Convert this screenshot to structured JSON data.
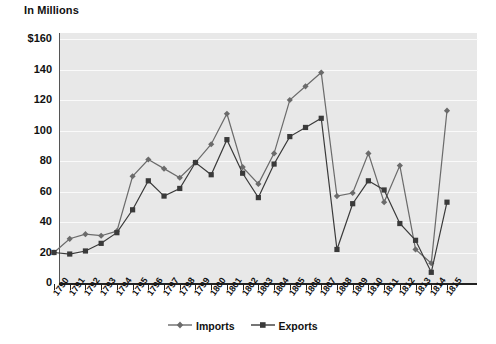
{
  "chart_data": {
    "type": "line",
    "title": "",
    "subtitle": "",
    "units_label": "In Millions",
    "xlabel": "",
    "ylabel": "",
    "ylim": [
      0,
      160
    ],
    "ytick_values": [
      160,
      140,
      120,
      100,
      80,
      60,
      40,
      20,
      0
    ],
    "ytick_labels": [
      "$160",
      "140",
      "120",
      "100",
      "80",
      "60",
      "40",
      "20",
      "0"
    ],
    "grid": true,
    "grid_axis": "y",
    "legend_position": "bottom-center",
    "categories": [
      "1790",
      "1791",
      "1792",
      "1793",
      "1794",
      "1795",
      "1796",
      "1797",
      "1798",
      "1799",
      "1800",
      "1801",
      "1802",
      "1803",
      "1804",
      "1805",
      "1806",
      "1807",
      "1808",
      "1809",
      "1810",
      "1811",
      "1812",
      "1813",
      "1814",
      "1815"
    ],
    "series": [
      {
        "name": "Imports",
        "color": "#6b6b6b",
        "marker": "diamond",
        "values": [
          20,
          29,
          32,
          31,
          34,
          70,
          81,
          75,
          69,
          79,
          91,
          111,
          76,
          65,
          85,
          120,
          129,
          138,
          57,
          59,
          85,
          53,
          77,
          22,
          13,
          113
        ]
      },
      {
        "name": "Exports",
        "color": "#3a3a3a",
        "marker": "square",
        "values": [
          20,
          19,
          21,
          26,
          33,
          48,
          67,
          57,
          62,
          79,
          71,
          94,
          72,
          56,
          78,
          96,
          102,
          108,
          22,
          52,
          67,
          61,
          39,
          28,
          7,
          53
        ]
      }
    ],
    "legend": [
      "Imports",
      "Exports"
    ]
  },
  "colors": {
    "plot_background": "#e8e8e8",
    "page_background": "#ffffff",
    "gridline": "#fafafa",
    "axis": "#222222",
    "imports": "#6b6b6b",
    "exports": "#3a3a3a",
    "text": "#111111"
  }
}
